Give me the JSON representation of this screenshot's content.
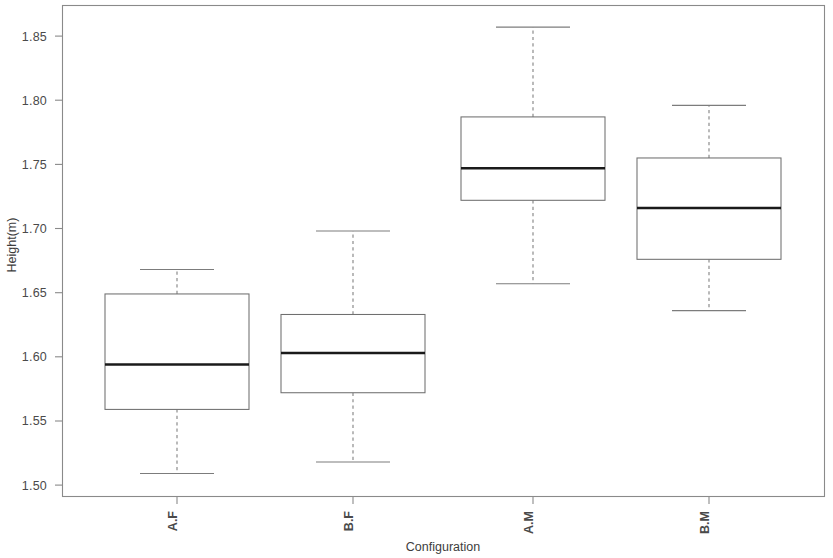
{
  "chart_data": {
    "type": "boxplot",
    "title": "",
    "xlabel": "Configuration",
    "ylabel": "Height(m)",
    "categories": [
      "A.F",
      "B.F",
      "A.M",
      "B.M"
    ],
    "ylim": [
      1.4885,
      1.8715
    ],
    "yticks": [
      1.5,
      1.55,
      1.6,
      1.65,
      1.7,
      1.75,
      1.8,
      1.85
    ],
    "ytick_labels": [
      "1.50",
      "1.55",
      "1.60",
      "1.65",
      "1.70",
      "1.75",
      "1.80",
      "1.85"
    ],
    "grid": false,
    "legend": null,
    "boxes": [
      {
        "category": "A.F",
        "whisker_low": 1.509,
        "q1": 1.559,
        "median": 1.594,
        "q3": 1.649,
        "whisker_high": 1.668
      },
      {
        "category": "B.F",
        "whisker_low": 1.518,
        "q1": 1.572,
        "median": 1.603,
        "q3": 1.633,
        "whisker_high": 1.698
      },
      {
        "category": "A.M",
        "whisker_low": 1.657,
        "q1": 1.722,
        "median": 1.747,
        "q3": 1.787,
        "whisker_high": 1.857
      },
      {
        "category": "B.M",
        "whisker_low": 1.636,
        "q1": 1.676,
        "median": 1.716,
        "q3": 1.755,
        "whisker_high": 1.796
      }
    ],
    "style": {
      "box_fill": "#ffffff",
      "box_stroke": "#6f6f6f",
      "median_color": "#1a1a1a",
      "whisker_color": "#7c7c7c",
      "frame_color": "#8a8a8a",
      "background": "#ffffff",
      "whisker_dashed": true,
      "category_labels_rotated": true
    }
  },
  "axes": {
    "y_title": "Height(m)",
    "x_title": "Configuration",
    "ytick_0": "1.50",
    "ytick_1": "1.55",
    "ytick_2": "1.60",
    "ytick_3": "1.65",
    "ytick_4": "1.70",
    "ytick_5": "1.75",
    "ytick_6": "1.80",
    "ytick_7": "1.85",
    "xtick_0": "A.F",
    "xtick_1": "B.F",
    "xtick_2": "A.M",
    "xtick_3": "B.M"
  }
}
